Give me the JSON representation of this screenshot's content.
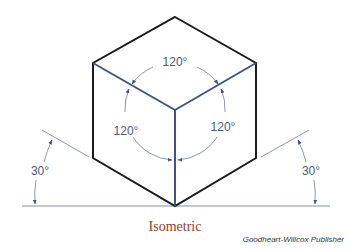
{
  "diagram": {
    "title": "Isometric",
    "credit": "Goodheart-Willcox Publisher",
    "angles": {
      "top": "120°",
      "left": "120°",
      "right": "120°",
      "left_base": "30°",
      "right_base": "30°"
    },
    "colors": {
      "outline": "#1a1a1a",
      "axis": "#3d5585",
      "arc": "#6e7c99",
      "baseline": "#7e8fb0",
      "caption": "#9b3a2a"
    }
  }
}
